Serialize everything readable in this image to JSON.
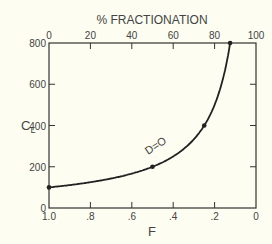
{
  "chart_data": {
    "type": "line",
    "title": "",
    "top_axis": {
      "label": "% FRACTIONATION",
      "ticks": [
        "0",
        "20",
        "40",
        "60",
        "80",
        "100"
      ],
      "range": [
        0,
        100
      ]
    },
    "bottom_axis": {
      "label": "F",
      "ticks": [
        "1.0",
        ".8",
        ".6",
        ".4",
        ".2",
        "0"
      ],
      "range": [
        1.0,
        0
      ]
    },
    "y_axis": {
      "label": "C",
      "label_sub": "L",
      "ticks": [
        "0",
        "200",
        "400",
        "600",
        "800"
      ],
      "range": [
        0,
        800
      ]
    },
    "xlabel": "F",
    "ylabel": "CL",
    "ylim": [
      0,
      800
    ],
    "xlim": [
      1.0,
      0
    ],
    "grid": false,
    "series": [
      {
        "name": "D=0",
        "annotation": "D=O",
        "x": [
          1.0,
          0.9,
          0.8,
          0.7,
          0.6,
          0.5,
          0.4,
          0.3,
          0.25,
          0.2,
          0.15,
          0.13,
          0.125
        ],
        "y": [
          100,
          111,
          125,
          143,
          167,
          200,
          250,
          333,
          400,
          500,
          667,
          770,
          800
        ]
      }
    ],
    "markers": [
      {
        "x": 1.0,
        "y": 100
      },
      {
        "x": 0.5,
        "y": 200
      },
      {
        "x": 0.25,
        "y": 400
      },
      {
        "x": 0.125,
        "y": 800
      }
    ]
  }
}
